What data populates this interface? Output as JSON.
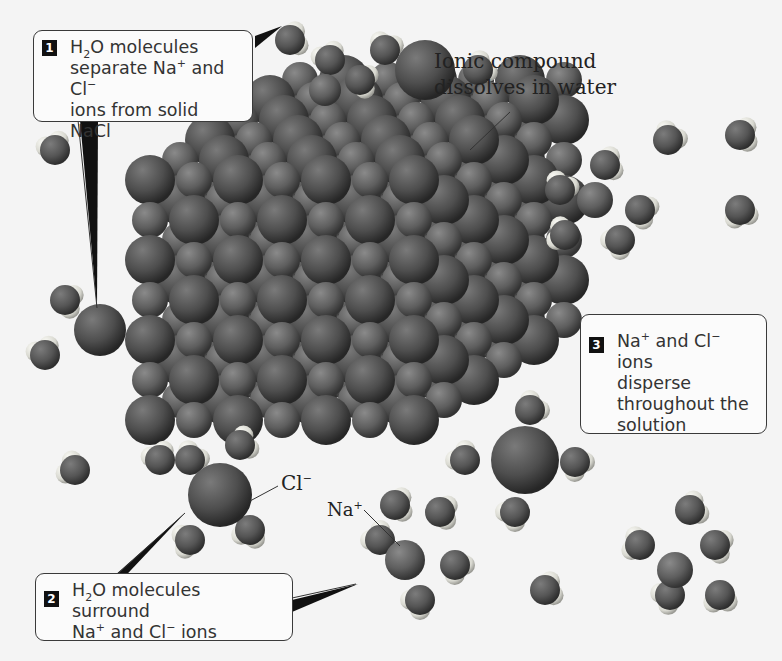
{
  "title": "Ionic compound dissolves in water",
  "labels": {
    "main": [
      "Ionic compound",
      "dissolves in water"
    ],
    "chloride": {
      "base": "Cl",
      "charge": "−"
    },
    "sodium": {
      "base": "Na",
      "charge": "+"
    }
  },
  "callouts": [
    {
      "step": "1",
      "lines": [
        {
          "a": "H",
          "sub": "2",
          "b": "O molecules"
        },
        {
          "a": "separate Na",
          "sup": "+",
          "b": " and Cl",
          "sup2": "−"
        },
        {
          "a": "ions from solid NaCl"
        }
      ]
    },
    {
      "step": "2",
      "lines": [
        {
          "a": "H",
          "sub": "2",
          "b": "O molecules surround"
        },
        {
          "a": "Na",
          "sup": "+",
          "b": " and Cl",
          "sup2": "−",
          "c": " ions"
        }
      ]
    },
    {
      "step": "3",
      "lines": [
        {
          "a": "Na",
          "sup": "+",
          "b": " and Cl",
          "sup2": "−",
          "c": " ions"
        },
        {
          "a": "disperse"
        },
        {
          "a": "throughout the"
        },
        {
          "a": "solution"
        }
      ]
    }
  ],
  "colors": {
    "background": "#f4f4f4",
    "ion_dark": "#4a4a4a",
    "ion_light": "#6a6a6a",
    "hydrogen": "#e6e6e0",
    "oxygen": "#5a5a5a",
    "border": "#3a3a3a"
  }
}
